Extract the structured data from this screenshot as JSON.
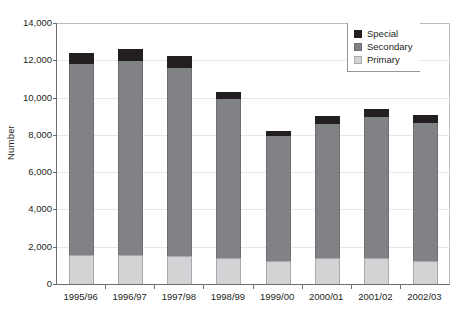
{
  "chart_data": {
    "type": "bar",
    "subtype": "stacked-bar",
    "title": "",
    "xlabel": "",
    "ylabel": "Number",
    "ylim": [
      0,
      14000
    ],
    "ytick_values": [
      0,
      2000,
      4000,
      6000,
      8000,
      10000,
      12000,
      14000
    ],
    "ytick_labels": [
      "0",
      "2,000",
      "4,000",
      "6,000",
      "8,000",
      "10,000",
      "12,000",
      "14,000"
    ],
    "grid": true,
    "legend_position": "top-right",
    "categories": [
      "1995/96",
      "1996/97",
      "1997/98",
      "1998/99",
      "1999/00",
      "2000/01",
      "2001/02",
      "2002/03"
    ],
    "series": [
      {
        "name": "Primary",
        "color": "#d1d3d4",
        "values": [
          1550,
          1550,
          1500,
          1400,
          1250,
          1400,
          1400,
          1250
        ]
      },
      {
        "name": "Secondary",
        "color": "#808285",
        "values": [
          10250,
          10400,
          10100,
          8550,
          6700,
          7200,
          7550,
          7400
        ]
      },
      {
        "name": "Special",
        "color": "#231f20",
        "values": [
          600,
          650,
          650,
          350,
          250,
          400,
          450,
          400
        ]
      }
    ],
    "totals": [
      12400,
      12600,
      12250,
      10300,
      8200,
      9000,
      9400,
      9050
    ]
  },
  "legend": {
    "items": [
      {
        "label": "Special",
        "swatch": "#231f20",
        "border": "#231f20"
      },
      {
        "label": "Secondary",
        "swatch": "#808285",
        "border": "#6d6e71"
      },
      {
        "label": "Primary",
        "swatch": "#d1d3d4",
        "border": "#a7a9ac"
      }
    ]
  },
  "axis": {
    "y_title": "Number"
  }
}
